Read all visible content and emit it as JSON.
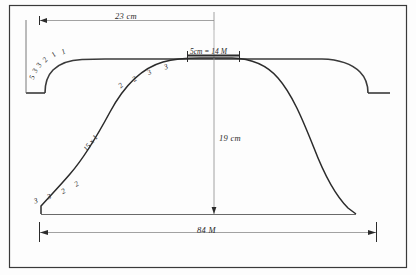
{
  "drawing": {
    "title": "knitting-pattern-profile-diagram",
    "frame": {
      "stroke": "#3a3a3a"
    },
    "ink": "#2b2b2b",
    "thin_ink": "#8a8a8a"
  },
  "dimensions": {
    "top_width": "23 cm",
    "scale_note": "5cm = 14 M",
    "center_height": "19 cm",
    "bottom_width": "84 M"
  },
  "annotations": {
    "left_shoulder_counts": [
      "5",
      "3",
      "3",
      "2",
      "1",
      "1"
    ],
    "hump_lower_left_counts": [
      "3",
      "3",
      "2",
      "2"
    ],
    "hump_upper_left_counts": [
      "2",
      "2",
      "3",
      "3"
    ],
    "slope_note": "15 x 1"
  },
  "icons": {
    "arrow_left": "arrow-left-icon",
    "arrow_right": "arrow-right-icon",
    "arrow_down": "arrow-down-icon",
    "tick": "tick-mark-icon"
  }
}
